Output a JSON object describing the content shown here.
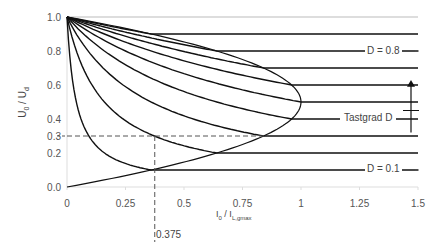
{
  "chart_data": {
    "type": "line",
    "title": "",
    "xlabel": "I0 / IL,gmax",
    "xlabel_main": "I",
    "xlabel_sub0": "0",
    "xlabel_mid": " / I",
    "xlabel_sub1": "L,gmax",
    "ylabel_main": "U",
    "ylabel_sub0": "0",
    "ylabel_mid": " / U",
    "ylabel_sub1": "d",
    "xlim": [
      0,
      1.5
    ],
    "ylim": [
      0,
      1.0
    ],
    "x_ticks": [
      "0",
      "0.25",
      "0.5",
      "0.75",
      "1",
      "1.25",
      "1.5"
    ],
    "y_ticks": [
      "0.0",
      "0.2",
      "0.3",
      "0.4",
      "0.6",
      "0.8",
      "1.0"
    ],
    "duty_cycles": [
      0.1,
      0.2,
      0.3,
      0.4,
      0.5,
      0.6,
      0.7,
      0.8,
      0.9
    ],
    "formula_dcm": "U0/Ud = D^2 / (D^2 + 0.25 * I0/IL,gmax)",
    "boundary": "I0/IL,gmax = 4 D (1 - D), U0/Ud = D",
    "annotations": {
      "d_high": "D = 0.8",
      "d_low": "D = 0.1",
      "arrow_label": "Tastgrad D",
      "marker_x": "0.375",
      "marker_point": [
        0.375,
        0.3
      ]
    },
    "grid": false
  }
}
